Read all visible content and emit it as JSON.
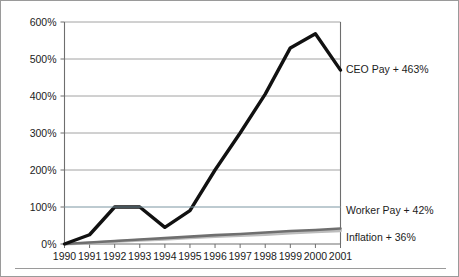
{
  "chart_data": {
    "type": "line",
    "title": "",
    "subtitle": "",
    "xlabel": "",
    "ylabel": "",
    "x": [
      1990,
      1991,
      1992,
      1993,
      1994,
      1995,
      1996,
      1997,
      1998,
      1999,
      2000,
      2001
    ],
    "categories": [
      "1990",
      "1991",
      "1992",
      "1993",
      "1994",
      "1995",
      "1996",
      "1997",
      "1998",
      "1999",
      "2000",
      "2001"
    ],
    "ylim": [
      0,
      600
    ],
    "xlim": [
      1990,
      2001
    ],
    "yticks": [
      0,
      100,
      200,
      300,
      400,
      500,
      600
    ],
    "ytick_labels": [
      "0%",
      "100%",
      "200%",
      "300%",
      "400%",
      "500%",
      "600%"
    ],
    "grid": true,
    "legend_position": "right-inline-annotations",
    "series": [
      {
        "name": "CEO Pay",
        "color": "#111111",
        "width": 3.4,
        "values": [
          0,
          25,
          100,
          100,
          45,
          90,
          200,
          300,
          405,
          530,
          568,
          470
        ],
        "end_label": "CEO Pay + 463%",
        "end_value": 463
      },
      {
        "name": "Worker Pay",
        "color": "#6f6f6f",
        "width": 2.6,
        "values": [
          0,
          4,
          8,
          12,
          16,
          20,
          24,
          27,
          31,
          35,
          38,
          42
        ],
        "end_label": "Worker Pay + 42%",
        "end_value": 42
      },
      {
        "name": "Inflation",
        "color": "#bdbdbd",
        "width": 3.0,
        "values": [
          0,
          3,
          7,
          10,
          13,
          17,
          20,
          23,
          26,
          30,
          33,
          36
        ],
        "end_label": "Inflation + 36%",
        "end_value": 36
      }
    ],
    "annotations": [
      {
        "text": "CEO Pay + 463%",
        "series": "CEO Pay",
        "x": 2001,
        "y": 470
      },
      {
        "text": "Worker Pay + 42%",
        "series": "Worker Pay",
        "x": 2001,
        "y": 100
      },
      {
        "text": "Inflation + 36%",
        "series": "Inflation",
        "x": 2001,
        "y": 36
      }
    ]
  },
  "axes": {
    "y_ticks": [
      {
        "label": "600%",
        "value": 600
      },
      {
        "label": "500%",
        "value": 500
      },
      {
        "label": "400%",
        "value": 400
      },
      {
        "label": "300%",
        "value": 300
      },
      {
        "label": "200%",
        "value": 200
      },
      {
        "label": "100%",
        "value": 100
      },
      {
        "label": "0%",
        "value": 0
      }
    ],
    "x_ticks": [
      {
        "label": "1990"
      },
      {
        "label": "1991"
      },
      {
        "label": "1992"
      },
      {
        "label": "1993"
      },
      {
        "label": "1994"
      },
      {
        "label": "1995"
      },
      {
        "label": "1996"
      },
      {
        "label": "1997"
      },
      {
        "label": "1998"
      },
      {
        "label": "1999"
      },
      {
        "label": "2000"
      },
      {
        "label": "2001"
      }
    ]
  },
  "labels": {
    "ceo": "CEO Pay + 463%",
    "worker": "Worker Pay + 42%",
    "inflation": "Inflation + 36%"
  },
  "colors": {
    "ceo_line": "#111111",
    "worker_line": "#6f6f6f",
    "inflation_line": "#bdbdbd",
    "gridline": "#8c8c8c",
    "axis": "#6e6e6e",
    "border": "#9a9a9a",
    "text": "#1c1c1c",
    "background": "#ffffff"
  }
}
